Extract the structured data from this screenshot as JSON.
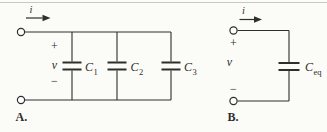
{
  "meta": {
    "background": "#fbfbf7",
    "line_color": "#2e2e2e",
    "border_color": "#c9c9c4"
  },
  "circuit_a": {
    "figure_label": "A.",
    "current_label": "i",
    "voltage_label": "v",
    "plus_sign": "+",
    "minus_sign": "−",
    "capacitors": [
      {
        "symbol": "C",
        "subscript": "1"
      },
      {
        "symbol": "C",
        "subscript": "2"
      },
      {
        "symbol": "C",
        "subscript": "3"
      }
    ]
  },
  "circuit_b": {
    "figure_label": "B.",
    "current_label": "i",
    "voltage_label": "v",
    "plus_sign": "+",
    "minus_sign": "−",
    "capacitor": {
      "symbol": "C",
      "subscript": "eq"
    }
  }
}
